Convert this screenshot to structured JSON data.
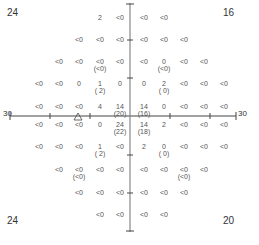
{
  "corners": {
    "top_left": "24",
    "top_right": "16",
    "bottom_left": "24",
    "bottom_right": "20"
  },
  "axis_labels": {
    "left": "30",
    "right": "30"
  },
  "blind_spot_marker": "triangle",
  "grid": {
    "columns": [
      "-27",
      "-21",
      "-15",
      "-9",
      "-3",
      "3",
      "9",
      "15",
      "21",
      "27"
    ],
    "rows": [
      {
        "y": "21",
        "cells": [
          null,
          null,
          null,
          {
            "v": "2"
          },
          {
            "v": "<0"
          },
          {
            "v": "<0"
          },
          {
            "v": "<0"
          },
          null,
          null,
          null
        ]
      },
      {
        "y": "15",
        "cells": [
          null,
          null,
          {
            "v": "<0"
          },
          {
            "v": "<0"
          },
          {
            "v": "<0"
          },
          {
            "v": "<0"
          },
          {
            "v": "<0"
          },
          {
            "v": "<0"
          },
          null,
          null
        ]
      },
      {
        "y": "9",
        "cells": [
          null,
          {
            "v": "<0"
          },
          {
            "v": "<0"
          },
          {
            "v": "<0",
            "r": "(<0)"
          },
          {
            "v": "<0"
          },
          {
            "v": "<0"
          },
          {
            "v": "0",
            "r": "(<0)"
          },
          {
            "v": "<0"
          },
          {
            "v": "<0"
          },
          null
        ]
      },
      {
        "y": "3",
        "cells": [
          {
            "v": "<0"
          },
          {
            "v": "<0"
          },
          {
            "v": "0"
          },
          {
            "v": "1",
            "r": "( 2)"
          },
          {
            "v": "0"
          },
          {
            "v": "0"
          },
          {
            "v": "2",
            "r": "( 0)"
          },
          {
            "v": "<0"
          },
          {
            "v": "<0"
          },
          {
            "v": "<0"
          }
        ]
      },
      {
        "y": "1",
        "cells": [
          {
            "v": "<0"
          },
          {
            "v": "<0"
          },
          {
            "v": "<0"
          },
          {
            "v": "4"
          },
          {
            "v": "14",
            "r": "(20)"
          },
          {
            "v": "14",
            "r": "(16)"
          },
          {
            "v": "0"
          },
          {
            "v": "<0"
          },
          {
            "v": "<0"
          },
          {
            "v": "<0"
          }
        ]
      },
      {
        "y": "-1",
        "cells": [
          {
            "v": "<0"
          },
          {
            "v": "<0"
          },
          {
            "v": "<0"
          },
          {
            "v": "0"
          },
          {
            "v": "24",
            "r": "(22)"
          },
          {
            "v": "14",
            "r": "(18)"
          },
          {
            "v": "2"
          },
          {
            "v": "<0"
          },
          {
            "v": "<0"
          },
          {
            "v": "<0"
          }
        ]
      },
      {
        "y": "-3",
        "cells": [
          {
            "v": "<0"
          },
          {
            "v": "<0"
          },
          {
            "v": "<0"
          },
          {
            "v": "1",
            "r": "( 2)"
          },
          {
            "v": "<0"
          },
          {
            "v": "2"
          },
          {
            "v": "0",
            "r": "( 0)"
          },
          {
            "v": "<0"
          },
          {
            "v": "<0"
          },
          {
            "v": "<0"
          }
        ]
      },
      {
        "y": "-9",
        "cells": [
          null,
          {
            "v": "<0"
          },
          {
            "v": "<0",
            "r": "(<0)"
          },
          {
            "v": "<0"
          },
          {
            "v": "<0"
          },
          {
            "v": "<0"
          },
          {
            "v": "<0"
          },
          {
            "v": "<0",
            "r": "(<0)"
          },
          {
            "v": "<0"
          },
          null
        ]
      },
      {
        "y": "-15",
        "cells": [
          null,
          null,
          {
            "v": "<0"
          },
          {
            "v": "<0"
          },
          {
            "v": "<0"
          },
          {
            "v": "<0"
          },
          {
            "v": "<0"
          },
          {
            "v": "<0"
          },
          null,
          null
        ]
      },
      {
        "y": "-21",
        "cells": [
          null,
          null,
          null,
          {
            "v": "<0"
          },
          {
            "v": "<0"
          },
          {
            "v": "<0"
          },
          {
            "v": "<0"
          },
          null,
          null,
          null
        ]
      }
    ]
  }
}
